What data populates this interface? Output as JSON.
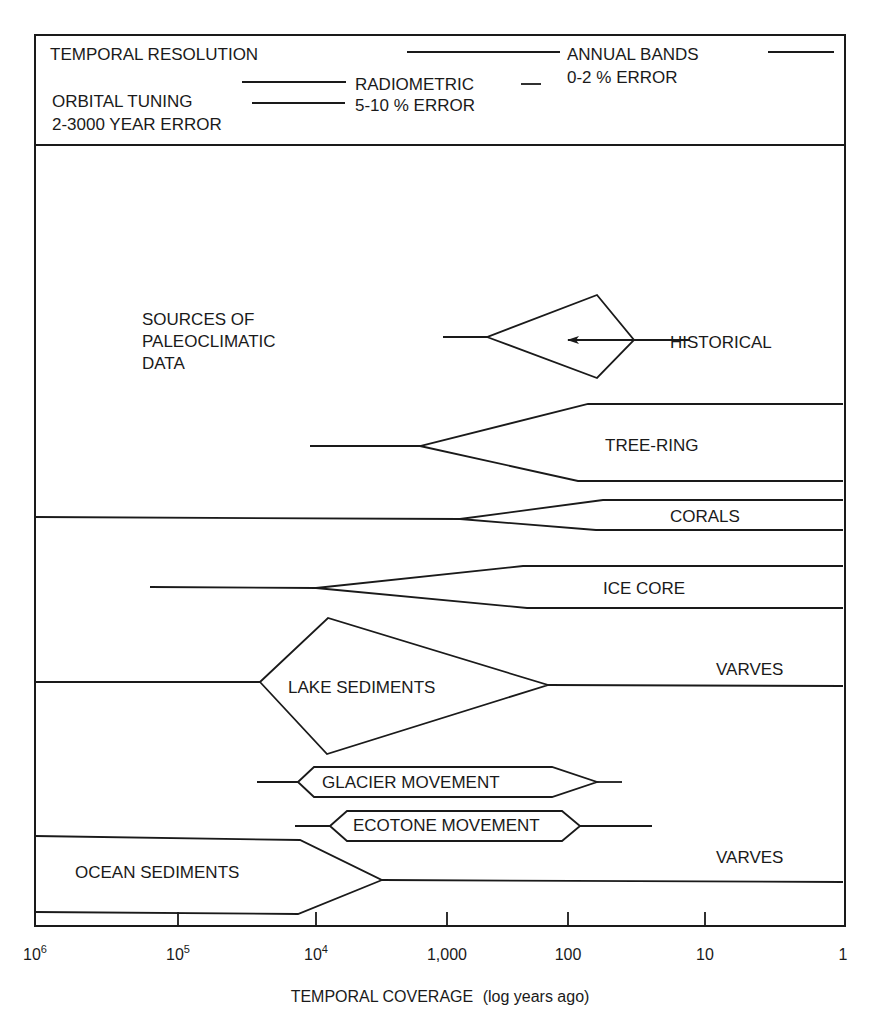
{
  "header": {
    "temporal_resolution_label": "TEMPORAL RESOLUTION",
    "annual_bands_label": "ANNUAL BANDS",
    "annual_bands_error": "0-2 % ERROR",
    "radiometric_label": "RADIOMETRIC",
    "radiometric_error": "5-10 % ERROR",
    "orbital_tuning_label": "ORBITAL TUNING",
    "orbital_tuning_error": "2-3000 YEAR ERROR"
  },
  "plot": {
    "panel_title_lines": [
      "SOURCES OF",
      "PALEOCLIMATIC",
      "DATA"
    ],
    "x_axis_title_main": "TEMPORAL COVERAGE",
    "x_axis_title_sub": "(log years ago)",
    "ticks": [
      {
        "label": "10",
        "sup": "6",
        "x": 35
      },
      {
        "label": "10",
        "sup": "5",
        "x": 178
      },
      {
        "label": "10",
        "sup": "4",
        "x": 316
      },
      {
        "label": "1,000",
        "sup": "",
        "x": 447
      },
      {
        "label": "100",
        "sup": "",
        "x": 568
      },
      {
        "label": "10",
        "sup": "",
        "x": 705
      },
      {
        "label": "1",
        "sup": "",
        "x": 843
      }
    ]
  },
  "sources": [
    {
      "name": "HISTORICAL",
      "label_x": 670,
      "label_y": 348,
      "shapes": [
        "M443,337 L487,337 L597,295 L634,340 L597,378 L487,337",
        "M634,340 L690,340"
      ],
      "arrow": {
        "x1": 634,
        "y1": 340,
        "x2": 568,
        "y2": 340
      }
    },
    {
      "name": "TREE-RING",
      "label_x": 605,
      "label_y": 451,
      "shapes": [
        "M310,446 L420,446 L588,404 L843,404",
        "M420,446 L578,481 L843,481"
      ]
    },
    {
      "name": "CORALS",
      "label_x": 670,
      "label_y": 522,
      "shapes": [
        "M35,517 L460,519 L603,500 L843,500",
        "M460,519 L596,530 L843,530"
      ]
    },
    {
      "name": "ICE CORE",
      "label_x": 603,
      "label_y": 594,
      "shapes": [
        "M150,587 L316,588 L523,566 L843,566",
        "M316,588 L527,608 L843,608"
      ]
    },
    {
      "name": "LAKE SEDIMENTS",
      "label_x": 288,
      "label_y": 693,
      "shapes": [
        "M35,682 L260,682 L328,618 L548,685 L327,754 L260,682",
        "M548,685 L843,686"
      ],
      "sub_label": "VARVES",
      "sub_label_x": 716,
      "sub_label_y": 675
    },
    {
      "name": "GLACIER MOVEMENT",
      "label_x": 322,
      "label_y": 788,
      "shapes": [
        "M257,782 L298,782 L314,767 L552,767 L597,782 L552,797 L314,797 L298,782",
        "M597,782 L622,782"
      ]
    },
    {
      "name": "ECOTONE MOVEMENT",
      "label_x": 353,
      "label_y": 831,
      "shapes": [
        "M295,826 L330,826 L347,811 L562,811 L580,826 L562,841 L347,841 L330,826",
        "M580,826 L652,826"
      ]
    },
    {
      "name": "OCEAN SEDIMENTS",
      "label_x": 75,
      "label_y": 878,
      "shapes": [
        "M35,836 L300,840 L382,880 L843,882",
        "M35,912 L298,914 L382,880"
      ],
      "sub_label": "VARVES",
      "sub_label_x": 716,
      "sub_label_y": 863
    }
  ],
  "chart_data": {
    "type": "diagram",
    "title": "Sources of Paleoclimatic Data",
    "xlabel": "TEMPORAL COVERAGE (log years ago)",
    "x_scale": "log",
    "xlim": [
      1000000,
      1
    ],
    "x_ticks": [
      "10^6",
      "10^5",
      "10^4",
      "1,000",
      "100",
      "10",
      "1"
    ],
    "header_resolution": [
      {
        "method": "ANNUAL BANDS",
        "error": "0-2 % ERROR"
      },
      {
        "method": "RADIOMETRIC",
        "error": "5-10 % ERROR"
      },
      {
        "method": "ORBITAL TUNING",
        "error": "2-3000 YEAR ERROR"
      }
    ],
    "series": [
      {
        "name": "HISTORICAL",
        "coverage_years_ago": [
          1000,
          10
        ]
      },
      {
        "name": "TREE-RING",
        "coverage_years_ago": [
          10000,
          1
        ]
      },
      {
        "name": "CORALS",
        "coverage_years_ago": [
          1000000,
          1
        ]
      },
      {
        "name": "ICE CORE",
        "coverage_years_ago": [
          150000,
          1
        ]
      },
      {
        "name": "LAKE SEDIMENTS",
        "coverage_years_ago": [
          1000000,
          1
        ],
        "annotation": "VARVES"
      },
      {
        "name": "GLACIER MOVEMENT",
        "coverage_years_ago": [
          25000,
          30
        ]
      },
      {
        "name": "ECOTONE MOVEMENT",
        "coverage_years_ago": [
          14000,
          25
        ]
      },
      {
        "name": "OCEAN SEDIMENTS",
        "coverage_years_ago": [
          1000000,
          1
        ],
        "annotation": "VARVES"
      }
    ]
  }
}
